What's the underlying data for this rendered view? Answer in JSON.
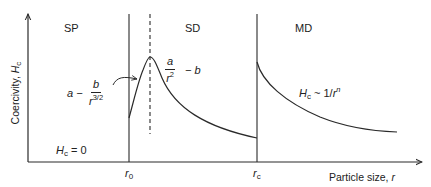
{
  "diagram": {
    "type": "coercivity-vs-particle-size",
    "regions": [
      {
        "id": "sp",
        "label": "SP"
      },
      {
        "id": "sd",
        "label": "SD"
      },
      {
        "id": "md",
        "label": "MD"
      }
    ],
    "axes": {
      "y_label_prefix": "Coercivity, ",
      "y_label_symbol": "H",
      "y_label_sub": "c",
      "x_label_prefix": "Particle size, ",
      "x_label_symbol": "r"
    },
    "ticks": {
      "r0_symbol": "r",
      "r0_sub": "0",
      "rc_symbol": "r",
      "rc_sub": "c"
    },
    "annotations": {
      "sp_eq": {
        "symbol": "H",
        "sub": "c",
        "rest": " = 0"
      },
      "rising_eq": {
        "prefix": "a −",
        "num": "b",
        "den_base": "r",
        "den_exp": "3/2"
      },
      "peak_eq": {
        "num": "a",
        "den_base": "r",
        "den_exp": "2",
        "suffix": "− b"
      },
      "md_eq": {
        "symbol": "H",
        "sub": "c",
        "rest": " ~ 1/",
        "base": "r",
        "exp": "n"
      }
    },
    "colors": {
      "line": "#2a2a2a",
      "background": "#ffffff"
    }
  }
}
